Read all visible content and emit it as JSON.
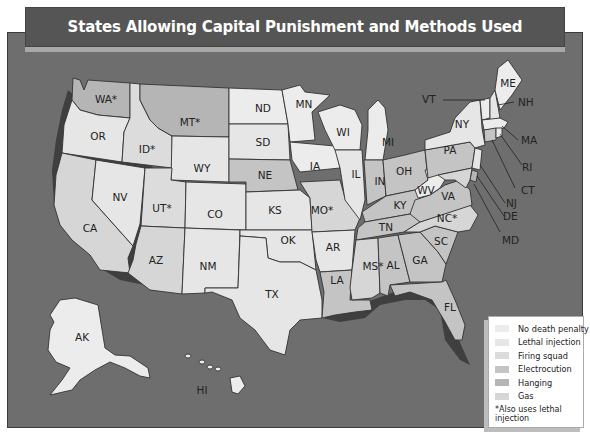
{
  "title": "States Allowing Capital Punishment and Methods Used",
  "legend": {
    "items": [
      {
        "key": "none",
        "label": "No death penalty",
        "color": "#ececec"
      },
      {
        "key": "lethal",
        "label": "Lethal injection",
        "color": "#e6e6e6"
      },
      {
        "key": "firing",
        "label": "Firing squad",
        "color": "#dcdcdc"
      },
      {
        "key": "electro",
        "label": "Electrocution",
        "color": "#c4c4c4"
      },
      {
        "key": "hanging",
        "label": "Hanging",
        "color": "#b5b5b5"
      },
      {
        "key": "gas",
        "label": "Gas",
        "color": "#d6d6d6"
      }
    ],
    "note": "*Also uses lethal injection"
  },
  "colors": {
    "ocean": "#6e6e6e",
    "title_bar": "#555555",
    "state_border": "#333333",
    "coast_shadow": "#3f3f3f"
  },
  "states": {
    "WA": {
      "label": "WA*",
      "method": "hanging"
    },
    "OR": {
      "label": "OR",
      "method": "lethal"
    },
    "CA": {
      "label": "CA",
      "method": "gas"
    },
    "ID": {
      "label": "ID*",
      "method": "firing"
    },
    "NV": {
      "label": "NV",
      "method": "lethal"
    },
    "MT": {
      "label": "MT*",
      "method": "hanging"
    },
    "WY": {
      "label": "WY",
      "method": "lethal"
    },
    "UT": {
      "label": "UT*",
      "method": "firing"
    },
    "CO": {
      "label": "CO",
      "method": "lethal"
    },
    "AZ": {
      "label": "AZ",
      "method": "gas"
    },
    "NM": {
      "label": "NM",
      "method": "lethal"
    },
    "ND": {
      "label": "ND",
      "method": "none"
    },
    "SD": {
      "label": "SD",
      "method": "lethal"
    },
    "NE": {
      "label": "NE",
      "method": "electro"
    },
    "KS": {
      "label": "KS",
      "method": "lethal"
    },
    "OK": {
      "label": "OK",
      "method": "lethal"
    },
    "TX": {
      "label": "TX",
      "method": "lethal"
    },
    "MN": {
      "label": "MN",
      "method": "none"
    },
    "IA": {
      "label": "IA",
      "method": "none"
    },
    "MO": {
      "label": "MO*",
      "method": "gas"
    },
    "AR": {
      "label": "AR",
      "method": "lethal"
    },
    "LA": {
      "label": "LA",
      "method": "electro"
    },
    "WI": {
      "label": "WI",
      "method": "none"
    },
    "IL": {
      "label": "IL",
      "method": "lethal"
    },
    "MS": {
      "label": "MS*",
      "method": "gas"
    },
    "MI": {
      "label": "MI",
      "method": "none"
    },
    "IN": {
      "label": "IN",
      "method": "electro"
    },
    "KY": {
      "label": "KY",
      "method": "electro"
    },
    "TN": {
      "label": "TN",
      "method": "electro"
    },
    "AL": {
      "label": "AL",
      "method": "electro"
    },
    "OH": {
      "label": "OH",
      "method": "electro"
    },
    "GA": {
      "label": "GA",
      "method": "electro"
    },
    "FL": {
      "label": "FL",
      "method": "electro"
    },
    "SC": {
      "label": "SC",
      "method": "electro"
    },
    "NC": {
      "label": "NC*",
      "method": "gas"
    },
    "VA": {
      "label": "VA",
      "method": "electro"
    },
    "WV": {
      "label": "WV",
      "method": "none"
    },
    "PA": {
      "label": "PA",
      "method": "electro"
    },
    "NY": {
      "label": "NY",
      "method": "lethal"
    },
    "VT": {
      "label": "VT",
      "method": "none"
    },
    "NH": {
      "label": "NH",
      "method": "lethal"
    },
    "ME": {
      "label": "ME",
      "method": "none"
    },
    "MA": {
      "label": "MA",
      "method": "none"
    },
    "RI": {
      "label": "RI",
      "method": "none"
    },
    "CT": {
      "label": "CT",
      "method": "electro"
    },
    "NJ": {
      "label": "NJ",
      "method": "lethal"
    },
    "DE": {
      "label": "DE",
      "method": "hanging"
    },
    "MD": {
      "label": "MD",
      "method": "gas"
    },
    "AK": {
      "label": "AK",
      "method": "none"
    },
    "HI": {
      "label": "HI",
      "method": "none"
    }
  }
}
